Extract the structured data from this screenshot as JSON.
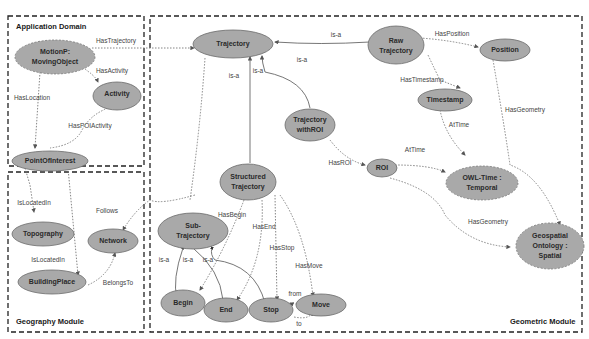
{
  "modules": {
    "application": "Application Domain",
    "geography": "Geography Module",
    "geometric": "Geometric Module"
  },
  "nodes": {
    "motionp": [
      "MotionP:",
      "MovingObject"
    ],
    "activity": "Activity",
    "poi": "PointOfInterest",
    "topography": "Topography",
    "network": "Network",
    "buildingplace": "BuildingPlace",
    "trajectory": "Trajectory",
    "raw": [
      "Raw",
      "Trajectory"
    ],
    "position": "Position",
    "timestamp": "Timestamp",
    "withroi": [
      "Trajectory",
      "withROI"
    ],
    "roi": "ROI",
    "owltime": [
      "OWL-Time :",
      "Temporal"
    ],
    "structured": [
      "Structured",
      "Trajectory"
    ],
    "subtraj": [
      "Sub-",
      "Trajectory"
    ],
    "geospatial": [
      "Geospatial",
      "Ontology :",
      "Spatial"
    ],
    "begin": "Begin",
    "end": "End",
    "stop": "Stop",
    "move": "Move"
  },
  "edges": {
    "has_trajectory": "HasTrajectory",
    "has_activity": "HasActivity",
    "has_location": "HasLocation",
    "has_poi_activity": "HasPOIActivity",
    "is_located_in_1": "IsLocatedIn",
    "is_located_in_2": "IsLocatedIn",
    "follows": "Follows",
    "belongs_to": "BelongsTo",
    "has_position": "HasPosition",
    "has_timestamp": "HasTimestamp",
    "at_time_1": "AtTime",
    "at_time_2": "AtTime",
    "has_roi": "HasROI",
    "has_geometry_1": "HasGeometry",
    "has_geometry_2": "HasGeometry",
    "is_a_raw": "is-a",
    "is_a_withroi": "is-a",
    "is_a_structured": "is-a",
    "is_a_withroi2": "is-a",
    "has_begin": "HasBegin",
    "has_end": "HasEnd",
    "has_stop": "HasStop",
    "has_move": "HasMove",
    "is_a_begin": "is-a",
    "is_a_end": "is-a",
    "is_a_stop": "is-a",
    "from": "from",
    "to": "to"
  }
}
